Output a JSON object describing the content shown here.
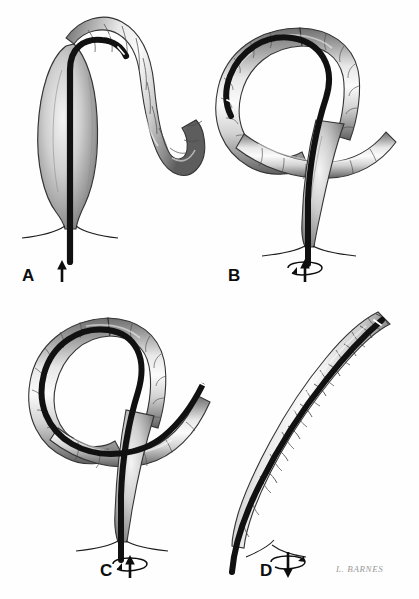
{
  "figure": {
    "style": "grayscale medical pen-and-ink wash illustration",
    "background_color": "#fefefe",
    "ink_color": "#0d0d0d",
    "scope_color": "#111111",
    "wall_fill_light": "#f2f2f2",
    "wall_fill_mid": "#b9b9b9",
    "wall_fill_dark": "#7d7d7d",
    "outline_color": "#3a3a3a",
    "panel_count": 4,
    "signature": "L. BARNES"
  },
  "panels": [
    {
      "id": "A",
      "label": "A",
      "label_x": 22,
      "label_y": 277,
      "caption": "Endoscope advanced up the dilated rectosigmoid to the twisted apex of the volvulus",
      "arrow": {
        "type": "straight-up",
        "direction": "up",
        "has_rotation": false,
        "x": 62,
        "y": 272
      },
      "scope_tip_marker": "white band at apex"
    },
    {
      "id": "B",
      "label": "B",
      "label_x": 228,
      "label_y": 277,
      "caption": "Scope passed through the twist into the closed loop, which is seen crossing the rectosigmoid",
      "arrow": {
        "type": "rotation-up",
        "direction": "up",
        "has_rotation": true,
        "x": 305,
        "y": 272
      },
      "scope_tip_marker": "white band on dark tip inside loop"
    },
    {
      "id": "C",
      "label": "C",
      "label_x": 100,
      "label_y": 572,
      "caption": "Continued advancement with torque derotates the loop; scope exits beyond the twist",
      "arrow": {
        "type": "rotation-up",
        "direction": "up",
        "has_rotation": true,
        "x": 130,
        "y": 568
      },
      "scope_tip_marker": "white band on tip at upper right"
    },
    {
      "id": "D",
      "label": "D",
      "label_x": 260,
      "label_y": 572,
      "caption": "Volvulus reduced; sigmoid colon straightened over the withdrawn endoscope",
      "arrow": {
        "type": "rotation-down",
        "direction": "down",
        "has_rotation": true,
        "x": 288,
        "y": 565
      },
      "scope_tip_marker": "white band near proximal tip"
    }
  ],
  "annotations": {
    "anal_verge_label": "anal verge",
    "scope_label": "endoscope",
    "colon_label": "sigmoid colon"
  }
}
